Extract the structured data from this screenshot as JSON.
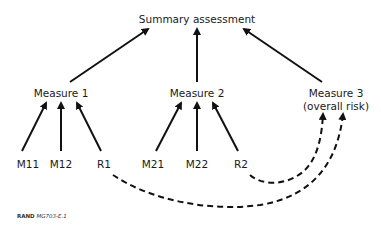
{
  "diagram": {
    "root": {
      "label": "Summary assessment"
    },
    "measures": [
      {
        "id": "measure-1",
        "label": "Measure 1"
      },
      {
        "id": "measure-2",
        "label": "Measure 2"
      },
      {
        "id": "measure-3",
        "label_line1": "Measure 3",
        "label_line2": "(overall risk)"
      }
    ],
    "leaves": [
      {
        "id": "M11",
        "label": "M11",
        "parent": "Measure 1"
      },
      {
        "id": "M12",
        "label": "M12",
        "parent": "Measure 1"
      },
      {
        "id": "R1",
        "label": "R1",
        "parent": "Measure 1",
        "also_feeds": "Measure 3"
      },
      {
        "id": "M21",
        "label": "M21",
        "parent": "Measure 2"
      },
      {
        "id": "M22",
        "label": "M22",
        "parent": "Measure 2"
      },
      {
        "id": "R2",
        "label": "R2",
        "parent": "Measure 2",
        "also_feeds": "Measure 3"
      }
    ],
    "edges_solid": [
      [
        "Measure 1",
        "Summary assessment"
      ],
      [
        "Measure 2",
        "Summary assessment"
      ],
      [
        "Measure 3",
        "Summary assessment"
      ],
      [
        "M11",
        "Measure 1"
      ],
      [
        "M12",
        "Measure 1"
      ],
      [
        "R1",
        "Measure 1"
      ],
      [
        "M21",
        "Measure 2"
      ],
      [
        "M22",
        "Measure 2"
      ],
      [
        "R2",
        "Measure 2"
      ]
    ],
    "edges_dashed": [
      [
        "R1",
        "Measure 3"
      ],
      [
        "R2",
        "Measure 3"
      ]
    ]
  },
  "credit": {
    "org": "RAND",
    "figure_id": "MG703-E.1"
  },
  "colors": {
    "line": "#111111",
    "text": "#1a1a1a",
    "background": "#ffffff"
  }
}
